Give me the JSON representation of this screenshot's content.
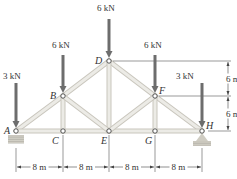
{
  "diagram": {
    "type": "roof truss",
    "nodes": [
      {
        "id": "A",
        "label": "A",
        "x": 16,
        "y": 131
      },
      {
        "id": "B",
        "label": "B",
        "x": 63,
        "y": 96
      },
      {
        "id": "C",
        "label": "C",
        "x": 63,
        "y": 131
      },
      {
        "id": "D",
        "label": "D",
        "x": 109,
        "y": 61
      },
      {
        "id": "E",
        "label": "E",
        "x": 109,
        "y": 131
      },
      {
        "id": "F",
        "label": "F",
        "x": 155,
        "y": 96
      },
      {
        "id": "G",
        "label": "G",
        "x": 155,
        "y": 131
      },
      {
        "id": "H",
        "label": "H",
        "x": 202,
        "y": 131
      }
    ],
    "members": [
      [
        "A",
        "B"
      ],
      [
        "B",
        "D"
      ],
      [
        "D",
        "F"
      ],
      [
        "F",
        "H"
      ],
      [
        "A",
        "C"
      ],
      [
        "C",
        "E"
      ],
      [
        "E",
        "G"
      ],
      [
        "G",
        "H"
      ],
      [
        "B",
        "C"
      ],
      [
        "D",
        "E"
      ],
      [
        "F",
        "G"
      ],
      [
        "B",
        "E"
      ],
      [
        "F",
        "E"
      ]
    ],
    "loads": [
      {
        "node": "A",
        "label": "3 kN"
      },
      {
        "node": "B",
        "label": "6 kN"
      },
      {
        "node": "D",
        "label": "6 kN"
      },
      {
        "node": "F",
        "label": "6 kN"
      },
      {
        "node": "H",
        "label": "3 kN"
      }
    ],
    "horizontal_dimensions": [
      "8 m",
      "8 m",
      "8 m",
      "8 m"
    ],
    "vertical_dimensions": [
      "6 m",
      "6 m"
    ],
    "supports": [
      {
        "node": "A",
        "type": "pin"
      },
      {
        "node": "H",
        "type": "roller"
      }
    ]
  }
}
